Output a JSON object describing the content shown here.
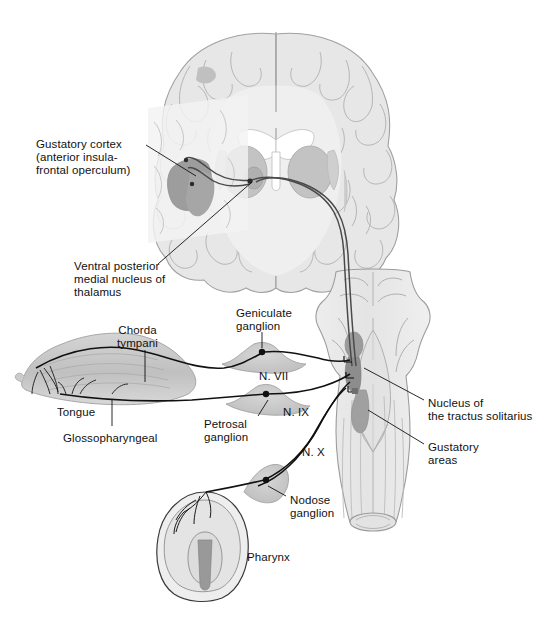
{
  "figure": {
    "background_color": "#ffffff",
    "line_color": "#111111",
    "palette": {
      "brain_fill": "#e6e6e6",
      "brain_gyri": "#dedede",
      "brain_outline": "#a8a8a8",
      "white_matter": "#ececec",
      "ventricle": "#ffffff",
      "thalamus": "#b8b8b8",
      "basal_ganglia": "#c4c4c4",
      "insula_highlight": "#9a9a9a",
      "overlay_panel": "#f2f2f2",
      "brainstem_fill": "#e9e9e9",
      "brainstem_outline": "#9a9a9a",
      "nucleus_solitarius": "#8f8f8f",
      "gustatory_area": "#a5a5a5",
      "tongue_fill": "#c9c9c9",
      "tongue_shade": "#b4b4b4",
      "ganglion_fill": "#c9c9c9",
      "pharynx_fill": "#e2e2e2",
      "pharynx_inner": "#9e9e9e",
      "nerve_stroke": "#111111"
    }
  },
  "labels": {
    "gustatory_cortex": {
      "lines": [
        "Gustatory cortex",
        "(anterior insula-",
        "frontal operculum)"
      ],
      "x": 36,
      "y": 138
    },
    "vpm_thalamus": {
      "lines": [
        "Ventral posterior",
        "medial nucleus of",
        "thalamus"
      ],
      "x": 74,
      "y": 260
    },
    "chorda_tympani": {
      "lines": [
        "Chorda",
        "tympani"
      ],
      "x": 117,
      "y": 324
    },
    "geniculate_ganglion": {
      "lines": [
        "Geniculate",
        "ganglion"
      ],
      "x": 236,
      "y": 307
    },
    "tongue": {
      "lines": [
        "Tongue"
      ],
      "x": 57,
      "y": 406
    },
    "glossopharyngeal": {
      "lines": [
        "Glossopharyngeal"
      ],
      "x": 63,
      "y": 432
    },
    "petrosal_ganglion": {
      "lines": [
        "Petrosal",
        "ganglion"
      ],
      "x": 204,
      "y": 418
    },
    "nerve_vii": {
      "lines": [
        "N. VII"
      ],
      "x": 259,
      "y": 370
    },
    "nerve_ix": {
      "lines": [
        "N. IX"
      ],
      "x": 283,
      "y": 406
    },
    "nerve_x": {
      "lines": [
        "N. X"
      ],
      "x": 302,
      "y": 446
    },
    "nodose_ganglion": {
      "lines": [
        "Nodose",
        "ganglion"
      ],
      "x": 290,
      "y": 494
    },
    "pharynx": {
      "lines": [
        "Pharynx"
      ],
      "x": 247,
      "y": 551
    },
    "nucleus_tractus_solitarius": {
      "lines": [
        "Nucleus of",
        "the tractus solitarius"
      ],
      "x": 428,
      "y": 397
    },
    "gustatory_areas": {
      "lines": [
        "Gustatory",
        "areas"
      ],
      "x": 428,
      "y": 441
    }
  },
  "structures": [
    {
      "name": "cerebral-hemispheres-coronal-section",
      "label": "Coronal section of cerebrum"
    },
    {
      "name": "lateral-ventricles",
      "label": "Lateral ventricles"
    },
    {
      "name": "thalamus-vpm",
      "label": "Ventral posterior medial nucleus of thalamus"
    },
    {
      "name": "insular-cortex-highlight",
      "label": "Anterior insula / frontal operculum"
    },
    {
      "name": "brainstem-dorsal-view",
      "label": "Brainstem (dorsal view)"
    },
    {
      "name": "nucleus-of-tractus-solitarius",
      "label": "Nucleus of the tractus solitarius"
    },
    {
      "name": "gustatory-area-rostral",
      "label": "Rostral gustatory area"
    },
    {
      "name": "gustatory-area-caudal",
      "label": "Caudal gustatory area"
    },
    {
      "name": "tongue-lateral-view",
      "label": "Tongue"
    },
    {
      "name": "geniculate-ganglion",
      "label": "Geniculate ganglion"
    },
    {
      "name": "petrosal-ganglion",
      "label": "Petrosal ganglion"
    },
    {
      "name": "nodose-ganglion",
      "label": "Nodose ganglion"
    },
    {
      "name": "pharynx",
      "label": "Pharynx"
    },
    {
      "name": "chorda-tympani-nerve",
      "label": "Chorda tympani branch of N. VII"
    },
    {
      "name": "glossopharyngeal-nerve",
      "label": "Glossopharyngeal nerve (N. IX)"
    },
    {
      "name": "vagus-nerve",
      "label": "Vagus nerve (N. X)"
    },
    {
      "name": "ascending-gustatory-tract",
      "label": "Ascending tract to thalamus and cortex"
    }
  ]
}
